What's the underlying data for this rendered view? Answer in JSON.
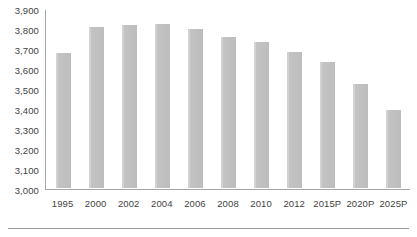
{
  "chart_data": {
    "type": "bar",
    "title": "",
    "subtitle": "",
    "xlabel": "",
    "ylabel": "",
    "categories": [
      "1995",
      "2000",
      "2002",
      "2004",
      "2006",
      "2008",
      "2010",
      "2012",
      "2015P",
      "2020P",
      "2025P"
    ],
    "values": [
      3675,
      3805,
      3815,
      3820,
      3795,
      3755,
      3730,
      3680,
      3630,
      3520,
      3390
    ],
    "series": [
      {
        "name": "",
        "values": [
          3675,
          3805,
          3815,
          3820,
          3795,
          3755,
          3730,
          3680,
          3630,
          3520,
          3390
        ]
      }
    ],
    "ylim": [
      3000,
      3900
    ],
    "ytick_step": 100,
    "ytick_labels": [
      "3,900",
      "3,800",
      "3,700",
      "3,600",
      "3,500",
      "3,400",
      "3,300",
      "3,200",
      "3,100",
      "3,000"
    ],
    "ytick_values": [
      3900,
      3800,
      3700,
      3600,
      3500,
      3400,
      3300,
      3200,
      3100,
      3000
    ],
    "grid": false,
    "legend": "none",
    "bar_color": "#c3c3c3",
    "axis_color": "#a6a6a6",
    "text_color": "#3f3f3f"
  }
}
